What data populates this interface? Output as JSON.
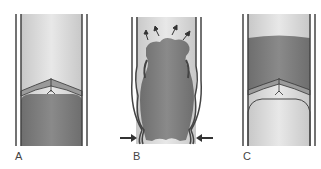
{
  "diagram": {
    "panels": [
      {
        "label": "A",
        "description": "valve closed, blood below"
      },
      {
        "label": "B",
        "description": "vein compressed, blood pushed upward through open valve"
      },
      {
        "label": "C",
        "description": "valve closed, blood above"
      }
    ],
    "colors": {
      "blood": "#7d7d7d",
      "lumen": "#d9d9d9",
      "wall": "#4a4a4a",
      "arrow": "#333333"
    }
  }
}
